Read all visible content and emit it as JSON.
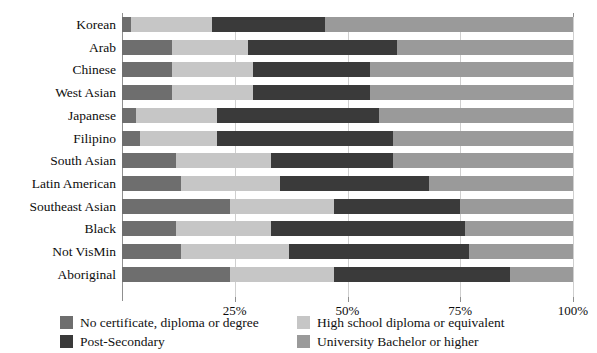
{
  "chart_data": {
    "type": "bar",
    "orientation": "horizontal",
    "stacked": true,
    "stack_mode": "percent",
    "title": "",
    "xlabel": "",
    "ylabel": "",
    "xlim": [
      0,
      100
    ],
    "grid": true,
    "grid_axis": "x",
    "legend_position": "bottom",
    "xticks": [
      "25%",
      "50%",
      "75%",
      "100%"
    ],
    "xtick_values": [
      25,
      50,
      75,
      100
    ],
    "categories": [
      "Korean",
      "Arab",
      "Chinese",
      "West Asian",
      "Japanese",
      "Filipino",
      "South Asian",
      "Latin American",
      "Southeast Asian",
      "Black",
      "Not VisMin",
      "Aboriginal"
    ],
    "series": [
      {
        "name": "No certificate, diploma or degree",
        "color": "#6e6e6e",
        "values": [
          2,
          11,
          11,
          11,
          3,
          4,
          12,
          13,
          24,
          12,
          13,
          24
        ]
      },
      {
        "name": "High school diploma or equivalent",
        "color": "#c6c6c6",
        "values": [
          18,
          17,
          18,
          18,
          18,
          17,
          21,
          22,
          23,
          21,
          24,
          23
        ]
      },
      {
        "name": "Post-Secondary",
        "color": "#3a3a3a",
        "values": [
          25,
          33,
          26,
          26,
          36,
          39,
          27,
          33,
          28,
          43,
          40,
          39
        ]
      },
      {
        "name": "University Bachelor or higher",
        "color": "#9a9a9a",
        "values": [
          55,
          39,
          45,
          45,
          43,
          40,
          40,
          32,
          25,
          24,
          23,
          14
        ]
      }
    ]
  },
  "legend": {
    "items": [
      {
        "label": "No certificate, diploma or degree",
        "color": "#6e6e6e"
      },
      {
        "label": "High school diploma or equivalent",
        "color": "#c6c6c6"
      },
      {
        "label": "Post-Secondary",
        "color": "#3a3a3a"
      },
      {
        "label": "University Bachelor or higher",
        "color": "#9a9a9a"
      }
    ]
  }
}
